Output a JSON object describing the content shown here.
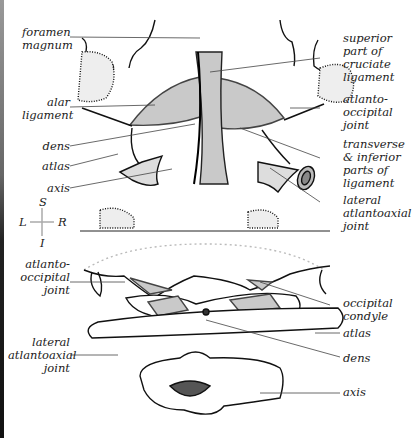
{
  "figure": {
    "top_view_labels_left": [
      {
        "id": "foramen-magnum",
        "text": "foramen\nmagnum"
      },
      {
        "id": "alar-ligament",
        "text": "alar\nligament"
      },
      {
        "id": "dens",
        "text": "dens"
      },
      {
        "id": "atlas",
        "text": "atlas"
      },
      {
        "id": "axis",
        "text": "axis"
      }
    ],
    "top_view_labels_right": [
      {
        "id": "superior-cruciate",
        "text": "superior\npart of\ncruciate\nligament"
      },
      {
        "id": "atlanto-occipital-joint",
        "text": "atlanto-\noccipital\njoint"
      },
      {
        "id": "transverse-inferior",
        "text": "transverse\n& inferior\nparts of\nligament"
      },
      {
        "id": "lateral-atlantoaxial-joint",
        "text": "lateral\natlantoaxial\njoint"
      }
    ],
    "compass": {
      "superior": "S",
      "inferior": "I",
      "left": "L",
      "right": "R"
    },
    "bottom_view_labels_left": [
      {
        "id": "atlanto-occipital-joint",
        "text": "atlanto-\noccipital\njoint"
      },
      {
        "id": "lateral-atlantoaxial-joint",
        "text": "lateral\natlantoaxial\njoint"
      }
    ],
    "bottom_view_labels_right": [
      {
        "id": "occipital-condyle",
        "text": "occipital\ncondyle"
      },
      {
        "id": "atlas",
        "text": "atlas"
      },
      {
        "id": "dens",
        "text": "dens"
      },
      {
        "id": "axis",
        "text": "axis"
      }
    ],
    "colors": {
      "ligament": "#c9c9c9",
      "bone_outline": "#111111",
      "leader": "#555555"
    }
  }
}
